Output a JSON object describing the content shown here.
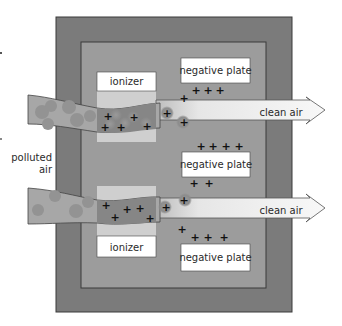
{
  "diagram": {
    "labels": {
      "input": [
        "polluted",
        "air"
      ],
      "ionizer_top": "ionizer",
      "ionizer_bottom": "ionizer",
      "plate_top": "negative plate",
      "plate_middle": "negative plate",
      "plate_bottom": "negative plate",
      "output_top": "clean air",
      "output_bottom": "clean air"
    },
    "charge_symbol": "+",
    "colors": {
      "outer_frame": "#7b7b7b",
      "inner_panel": "#9c9c9c",
      "ionizer_plate": "#cfcfcf",
      "polluted_stream": "#a7a7a7",
      "particle": "#8f8f8f",
      "charged_stream": "#858585",
      "clean_arrow": "#f4f4f4",
      "label_box": "#ffffff"
    }
  }
}
